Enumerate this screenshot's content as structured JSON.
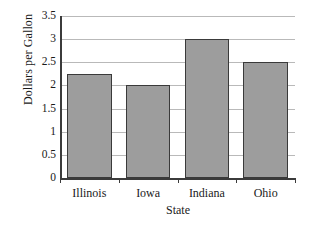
{
  "chart_data": {
    "type": "bar",
    "title": "",
    "xlabel": "State",
    "ylabel": "Dollars per Gallon",
    "categories": [
      "Illinois",
      "Iowa",
      "Indiana",
      "Ohio"
    ],
    "values": [
      2.25,
      2,
      3,
      2.5
    ],
    "ylim": [
      0,
      3.5
    ],
    "ytick_labels": [
      "3.5",
      "3",
      "2.5",
      "2",
      "1.5",
      "1",
      "0.5",
      "0"
    ],
    "ytick_values": [
      3.5,
      3,
      2.5,
      2,
      1.5,
      1,
      0.5,
      0
    ],
    "grid": "horizontal",
    "legend": "none",
    "bar_color": "#9d9d9d",
    "bar_border_color": "#3a3a3a",
    "gridline_color": "#b9b9b9",
    "axis_color": "#3b3b3b",
    "background_color": "#ffffff"
  }
}
